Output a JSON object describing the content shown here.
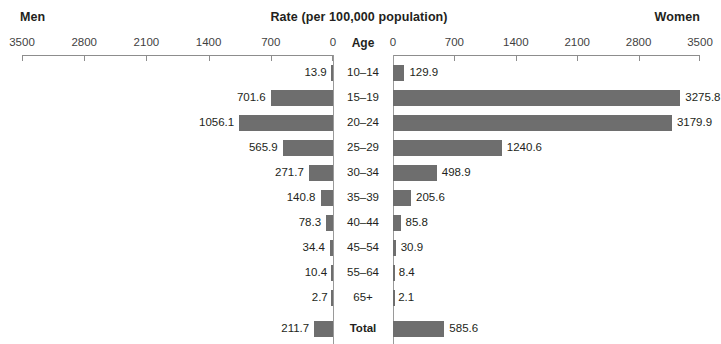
{
  "header": {
    "left_label": "Men",
    "right_label": "Women",
    "title": "Rate (per 100,000 population)",
    "age_column_label": "Age"
  },
  "axis": {
    "left_ticks": [
      "3500",
      "2800",
      "2100",
      "1400",
      "700",
      "0"
    ],
    "right_ticks": [
      "0",
      "700",
      "1400",
      "2100",
      "2800",
      "3500"
    ],
    "max": 3500,
    "tick_step": 700
  },
  "rows": [
    {
      "age": "10–14",
      "men": "13.9",
      "women": "129.9"
    },
    {
      "age": "15–19",
      "men": "701.6",
      "women": "3275.8"
    },
    {
      "age": "20–24",
      "men": "1056.1",
      "women": "3179.9"
    },
    {
      "age": "25–29",
      "men": "565.9",
      "women": "1240.6"
    },
    {
      "age": "30–34",
      "men": "271.7",
      "women": "498.9"
    },
    {
      "age": "35–39",
      "men": "140.8",
      "women": "205.6"
    },
    {
      "age": "40–44",
      "men": "78.3",
      "women": "85.8"
    },
    {
      "age": "45–54",
      "men": "34.4",
      "women": "30.9"
    },
    {
      "age": "55–64",
      "men": "10.4",
      "women": "8.4"
    },
    {
      "age": "65+",
      "men": "2.7",
      "women": "2.1"
    }
  ],
  "total_row": {
    "age": "Total",
    "men": "211.7",
    "women": "585.6"
  },
  "colors": {
    "bar": "#6e6e6e",
    "axis": "#8d8d8d",
    "text": "#231f20",
    "background": "#ffffff"
  },
  "chart_data": {
    "type": "bar",
    "title": "Rate (per 100,000 population)",
    "subtitle": "",
    "orientation": "horizontal-diverging",
    "categories": [
      "10–14",
      "15–19",
      "20–24",
      "25–29",
      "30–34",
      "35–39",
      "40–44",
      "45–54",
      "55–64",
      "65+",
      "Total"
    ],
    "series": [
      {
        "name": "Men",
        "side": "left",
        "values": [
          13.9,
          701.6,
          1056.1,
          565.9,
          271.7,
          140.8,
          78.3,
          34.4,
          10.4,
          2.7,
          211.7
        ]
      },
      {
        "name": "Women",
        "side": "right",
        "values": [
          129.9,
          3275.8,
          3179.9,
          1240.6,
          498.9,
          205.6,
          85.8,
          30.9,
          8.4,
          2.1,
          585.6
        ]
      }
    ],
    "xlabel": "Rate (per 100,000 population)",
    "ylabel": "Age",
    "xlim": [
      0,
      3500
    ],
    "xticks": [
      0,
      700,
      1400,
      2100,
      2800,
      3500
    ],
    "grid": false,
    "legend": "none",
    "data_labels": true
  }
}
